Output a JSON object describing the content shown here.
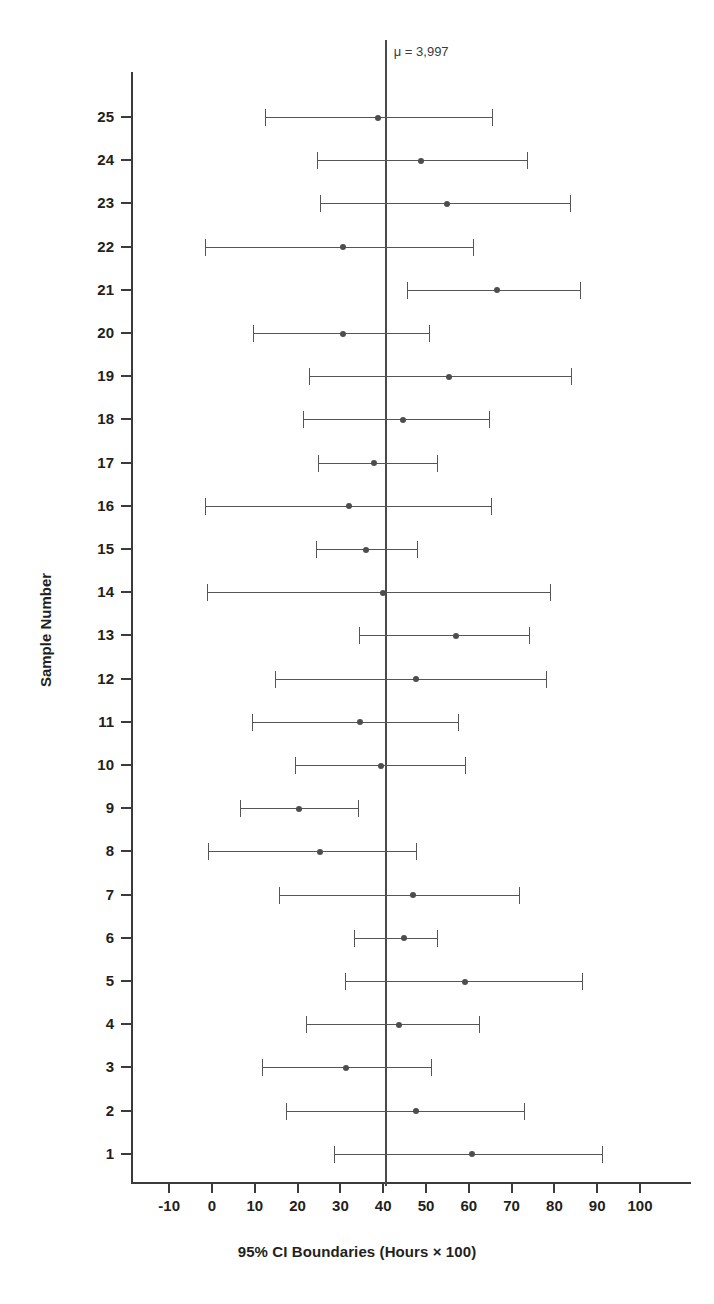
{
  "chart_data": {
    "type": "line",
    "title": "",
    "xlabel": "95% CI Boundaries (Hours × 100)",
    "ylabel": "Sample Number",
    "xlim": [
      -14,
      104
    ],
    "xticks": [
      -10,
      0,
      10,
      20,
      30,
      40,
      50,
      60,
      70,
      80,
      90,
      100
    ],
    "xtick_labels": [
      "-10",
      "0",
      "10",
      "20",
      "30",
      "40",
      "50",
      "60",
      "70",
      "80",
      "90",
      "100"
    ],
    "ylim": [
      0.4,
      25.6
    ],
    "yticks": [
      1,
      2,
      3,
      4,
      5,
      6,
      7,
      8,
      9,
      10,
      11,
      12,
      13,
      14,
      15,
      16,
      17,
      18,
      19,
      20,
      21,
      22,
      23,
      24,
      25
    ],
    "grid": false,
    "legend": null,
    "annotations": [
      {
        "name": "mean-reference-line",
        "text": "μ = 3,997",
        "x_value": 40.6
      }
    ],
    "series": [
      {
        "name": "95% confidence intervals",
        "marker": "point-estimate",
        "points": [
          {
            "sample": 25,
            "lower": 12.4,
            "mean": 38.8,
            "upper": 65.4
          },
          {
            "sample": 24,
            "lower": 24.5,
            "mean": 48.9,
            "upper": 73.5
          },
          {
            "sample": 23,
            "lower": 25.2,
            "mean": 55.0,
            "upper": 83.6
          },
          {
            "sample": 22,
            "lower": -1.6,
            "mean": 30.6,
            "upper": 61.0
          },
          {
            "sample": 21,
            "lower": 45.6,
            "mean": 66.6,
            "upper": 86.0
          },
          {
            "sample": 20,
            "lower": 9.6,
            "mean": 30.6,
            "upper": 50.7
          },
          {
            "sample": 19,
            "lower": 22.7,
            "mean": 55.4,
            "upper": 83.9
          },
          {
            "sample": 18,
            "lower": 21.3,
            "mean": 44.6,
            "upper": 64.8
          },
          {
            "sample": 17,
            "lower": 24.8,
            "mean": 37.9,
            "upper": 52.5
          },
          {
            "sample": 16,
            "lower": -1.6,
            "mean": 32.0,
            "upper": 65.1
          },
          {
            "sample": 15,
            "lower": 24.3,
            "mean": 36.0,
            "upper": 47.9
          },
          {
            "sample": 14,
            "lower": -1.2,
            "mean": 40.0,
            "upper": 79.0
          },
          {
            "sample": 13,
            "lower": 34.3,
            "mean": 57.0,
            "upper": 74.1
          },
          {
            "sample": 12,
            "lower": 14.7,
            "mean": 47.7,
            "upper": 78.0
          },
          {
            "sample": 11,
            "lower": 9.3,
            "mean": 34.6,
            "upper": 57.5
          },
          {
            "sample": 10,
            "lower": 19.4,
            "mean": 39.5,
            "upper": 59.1
          },
          {
            "sample": 9,
            "lower": 6.5,
            "mean": 20.3,
            "upper": 34.1
          },
          {
            "sample": 8,
            "lower": -0.9,
            "mean": 25.2,
            "upper": 47.7
          },
          {
            "sample": 7,
            "lower": 15.7,
            "mean": 47.0,
            "upper": 71.7
          },
          {
            "sample": 6,
            "lower": 33.2,
            "mean": 44.9,
            "upper": 52.6
          },
          {
            "sample": 5,
            "lower": 31.0,
            "mean": 59.0,
            "upper": 86.4
          },
          {
            "sample": 4,
            "lower": 22.0,
            "mean": 43.7,
            "upper": 62.4
          },
          {
            "sample": 3,
            "lower": 11.7,
            "mean": 31.3,
            "upper": 51.2
          },
          {
            "sample": 2,
            "lower": 17.3,
            "mean": 47.7,
            "upper": 72.9
          },
          {
            "sample": 1,
            "lower": 28.5,
            "mean": 60.7,
            "upper": 91.1
          }
        ]
      }
    ],
    "colors": {
      "axis": "#3b3b3b",
      "interval": "#555555",
      "marker": "#4d4d4d",
      "mean_line": "#4a4a4a",
      "background": "#ffffff"
    }
  }
}
